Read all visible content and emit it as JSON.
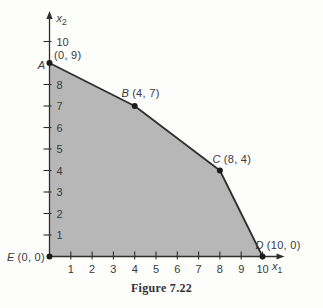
{
  "figure": {
    "caption": "Figure 7.22"
  },
  "colors": {
    "region_fill": "#b7b7b7",
    "line": "#2f2f2f",
    "dot": "#1c1c1c",
    "text": "#3a3a3a",
    "background": "#fdfdfc"
  },
  "chart_data": {
    "type": "area",
    "title": "Figure 7.22",
    "xlabel": {
      "base": "x",
      "sub": "1"
    },
    "ylabel": {
      "base": "x",
      "sub": "2"
    },
    "vertices": [
      {
        "name": "A",
        "x": 0,
        "y": 9,
        "coords_label": "(0, 9)"
      },
      {
        "name": "B",
        "x": 4,
        "y": 7,
        "coords_label": "(4, 7)"
      },
      {
        "name": "C",
        "x": 8,
        "y": 4,
        "coords_label": "(8, 4)"
      },
      {
        "name": "D",
        "x": 10,
        "y": 0,
        "coords_label": "(10, 0)"
      },
      {
        "name": "E",
        "x": 0,
        "y": 0,
        "coords_label": "(0, 0)"
      }
    ],
    "boundary_path": [
      "A",
      "B",
      "C",
      "D"
    ],
    "xticks": [
      1,
      2,
      3,
      4,
      5,
      6,
      7,
      8,
      9,
      10
    ],
    "yticks": [
      1,
      2,
      3,
      4,
      5,
      6,
      7,
      8,
      10
    ],
    "xlim": [
      0,
      11
    ],
    "ylim": [
      0,
      11.4
    ],
    "grid": false,
    "legend": "none"
  }
}
